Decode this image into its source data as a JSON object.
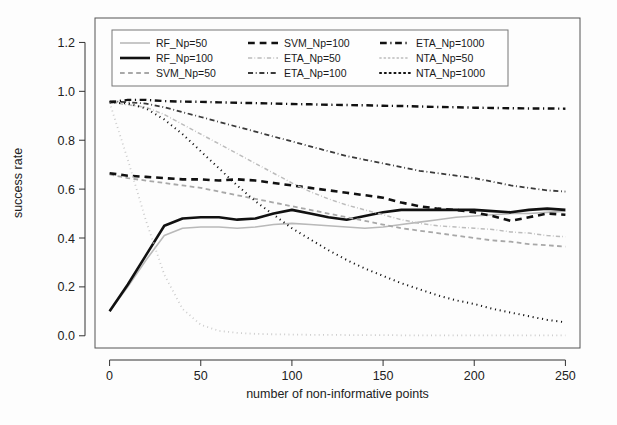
{
  "figure": {
    "background": "#fdfdfd",
    "frame_color": "#555555"
  },
  "axes": {
    "xlabel": "number of non-informative points",
    "ylabel": "success rate",
    "xticks": [
      "0",
      "50",
      "100",
      "150",
      "200",
      "250"
    ],
    "yticks": [
      "0.0",
      "0.2",
      "0.4",
      "0.6",
      "0.8",
      "1.0",
      "1.2"
    ]
  },
  "legend": {
    "entries": [
      {
        "label": "RF_Np=50",
        "color": "#b9b9b9",
        "width": 1.6,
        "dash": "none",
        "column": 0,
        "row": 0
      },
      {
        "label": "RF_Np=100",
        "color": "#111111",
        "width": 2.6,
        "dash": "none",
        "column": 0,
        "row": 1
      },
      {
        "label": "SVM_Np=50",
        "color": "#a8a8a8",
        "width": 1.8,
        "dash": "dashed",
        "column": 0,
        "row": 2
      },
      {
        "label": "SVM_Np=100",
        "color": "#111111",
        "width": 2.6,
        "dash": "dashed",
        "column": 1,
        "row": 0
      },
      {
        "label": "ETA_Np=50",
        "color": "#bcbcbc",
        "width": 1.5,
        "dash": "dashdot",
        "column": 1,
        "row": 1
      },
      {
        "label": "ETA_Np=100",
        "color": "#3a3a3a",
        "width": 1.8,
        "dash": "dashdot",
        "column": 1,
        "row": 2
      },
      {
        "label": "ETA_Np=1000",
        "color": "#111111",
        "width": 2.4,
        "dash": "dashdot",
        "column": 2,
        "row": 0
      },
      {
        "label": "NTA_Np=50",
        "color": "#cccccc",
        "width": 1.8,
        "dash": "dotted",
        "column": 2,
        "row": 1
      },
      {
        "label": "NTA_Np=1000",
        "color": "#111111",
        "width": 2.0,
        "dash": "dotted",
        "column": 2,
        "row": 2
      }
    ]
  },
  "chart_data": {
    "type": "line",
    "title": "",
    "xlabel": "number of non-informative points",
    "ylabel": "success rate",
    "xlim": [
      -8,
      258
    ],
    "ylim": [
      -0.05,
      1.3
    ],
    "grid": false,
    "legend_position": "top-left-inside",
    "x": [
      0,
      10,
      20,
      30,
      40,
      50,
      60,
      70,
      80,
      90,
      100,
      110,
      120,
      130,
      140,
      150,
      160,
      170,
      180,
      190,
      200,
      210,
      220,
      230,
      240,
      250
    ],
    "series": [
      {
        "name": "RF_Np=50",
        "color": "#b9b9b9",
        "dash": "none",
        "width": 1.6,
        "values": [
          0.1,
          0.2,
          0.31,
          0.41,
          0.44,
          0.445,
          0.445,
          0.44,
          0.445,
          0.455,
          0.46,
          0.455,
          0.45,
          0.445,
          0.44,
          0.445,
          0.455,
          0.465,
          0.475,
          0.485,
          0.49,
          0.495,
          0.5,
          0.5,
          0.505,
          0.51
        ]
      },
      {
        "name": "RF_Np=100",
        "color": "#111111",
        "dash": "none",
        "width": 2.6,
        "values": [
          0.1,
          0.21,
          0.33,
          0.45,
          0.48,
          0.485,
          0.485,
          0.475,
          0.48,
          0.5,
          0.515,
          0.5,
          0.485,
          0.475,
          0.49,
          0.505,
          0.515,
          0.515,
          0.515,
          0.515,
          0.515,
          0.51,
          0.505,
          0.515,
          0.52,
          0.515
        ]
      },
      {
        "name": "SVM_Np=50",
        "color": "#a8a8a8",
        "dash": "dashed",
        "width": 1.8,
        "values": [
          0.66,
          0.645,
          0.635,
          0.625,
          0.615,
          0.605,
          0.59,
          0.575,
          0.56,
          0.545,
          0.53,
          0.515,
          0.5,
          0.485,
          0.47,
          0.455,
          0.44,
          0.43,
          0.42,
          0.41,
          0.4,
          0.39,
          0.385,
          0.375,
          0.37,
          0.365
        ]
      },
      {
        "name": "SVM_Np=100",
        "color": "#111111",
        "dash": "dashed",
        "width": 2.6,
        "values": [
          0.665,
          0.655,
          0.65,
          0.645,
          0.64,
          0.64,
          0.635,
          0.64,
          0.635,
          0.625,
          0.615,
          0.605,
          0.595,
          0.585,
          0.575,
          0.565,
          0.545,
          0.53,
          0.52,
          0.515,
          0.505,
          0.49,
          0.47,
          0.485,
          0.5,
          0.495
        ]
      },
      {
        "name": "ETA_Np=50",
        "color": "#bcbcbc",
        "dash": "dashdot",
        "width": 1.5,
        "values": [
          0.955,
          0.945,
          0.935,
          0.905,
          0.865,
          0.825,
          0.785,
          0.745,
          0.705,
          0.665,
          0.625,
          0.59,
          0.56,
          0.535,
          0.515,
          0.495,
          0.475,
          0.46,
          0.45,
          0.445,
          0.44,
          0.435,
          0.425,
          0.42,
          0.41,
          0.405
        ]
      },
      {
        "name": "ETA_Np=100",
        "color": "#3a3a3a",
        "dash": "dashdot",
        "width": 1.8,
        "values": [
          0.96,
          0.955,
          0.95,
          0.935,
          0.915,
          0.895,
          0.875,
          0.855,
          0.835,
          0.815,
          0.795,
          0.775,
          0.755,
          0.735,
          0.72,
          0.705,
          0.69,
          0.675,
          0.665,
          0.655,
          0.645,
          0.63,
          0.615,
          0.605,
          0.595,
          0.59
        ]
      },
      {
        "name": "ETA_Np=1000",
        "color": "#111111",
        "dash": "dashdot",
        "width": 2.4,
        "values": [
          0.955,
          0.965,
          0.965,
          0.96,
          0.958,
          0.957,
          0.955,
          0.953,
          0.952,
          0.95,
          0.948,
          0.947,
          0.945,
          0.944,
          0.943,
          0.941,
          0.94,
          0.938,
          0.936,
          0.935,
          0.933,
          0.932,
          0.931,
          0.93,
          0.93,
          0.929
        ]
      },
      {
        "name": "NTA_Np=50",
        "color": "#cccccc",
        "dash": "dotted",
        "width": 1.8,
        "values": [
          0.955,
          0.72,
          0.47,
          0.25,
          0.11,
          0.045,
          0.02,
          0.012,
          0.008,
          0.006,
          0.005,
          0.004,
          0.004,
          0.003,
          0.003,
          0.003,
          0.002,
          0.002,
          0.002,
          0.002,
          0.002,
          0.002,
          0.002,
          0.002,
          0.002,
          0.002
        ]
      },
      {
        "name": "NTA_Np=1000",
        "color": "#111111",
        "dash": "dotted",
        "width": 2.0,
        "values": [
          0.955,
          0.95,
          0.93,
          0.885,
          0.825,
          0.755,
          0.685,
          0.615,
          0.55,
          0.495,
          0.44,
          0.395,
          0.35,
          0.31,
          0.275,
          0.245,
          0.215,
          0.19,
          0.165,
          0.145,
          0.13,
          0.11,
          0.095,
          0.08,
          0.065,
          0.055
        ]
      }
    ]
  }
}
